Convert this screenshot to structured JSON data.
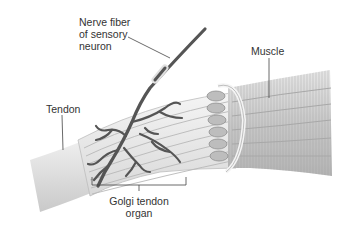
{
  "figure": {
    "colors": {
      "background": "#ffffff",
      "tendon": "#e2e2e2",
      "muscle": "#cfcfcf",
      "nerve": "#555555",
      "leader_line": "#444444",
      "label_text": "#333333"
    }
  },
  "labels": {
    "nerve_fiber": [
      "Nerve fiber",
      "of sensory",
      "neuron"
    ],
    "muscle": "Muscle",
    "tendon": "Tendon",
    "golgi_tendon_organ": [
      "Golgi tendon",
      "organ"
    ]
  }
}
